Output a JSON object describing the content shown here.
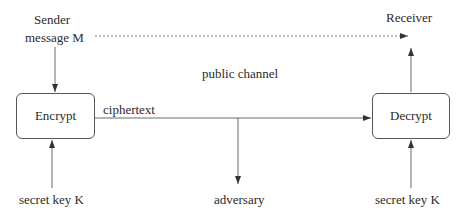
{
  "diagram": {
    "sender": {
      "line1": "Sender",
      "line2": "message M"
    },
    "receiver": "Receiver",
    "channel_label": "public channel",
    "encrypt_box": "Encrypt",
    "decrypt_box": "Decrypt",
    "ciphertext_label": "ciphertext",
    "adversary": "adversary",
    "key_left": "secret key K",
    "key_right": "secret key K",
    "colors": {
      "line": "#444444",
      "text": "#2a2a2a",
      "background": "#ffffff"
    }
  }
}
